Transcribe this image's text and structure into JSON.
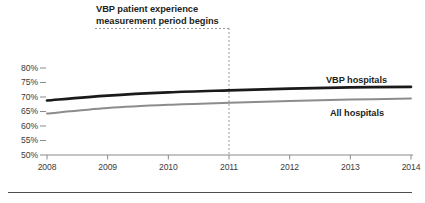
{
  "annotation": {
    "line1": "VBP patient experience",
    "line2": "measurement period begins",
    "marker_year": 2011
  },
  "axes": {
    "y_ticks": [
      "80%",
      "75%",
      "70%",
      "65%",
      "60%",
      "55%",
      "50%"
    ],
    "x_ticks": [
      "2008",
      "2009",
      "2010",
      "2011",
      "2012",
      "2013",
      "2014"
    ]
  },
  "legend": {
    "vbp": "VBP hospitals",
    "all": "All hospitals"
  },
  "colors": {
    "vbp_line": "#1a1a1a",
    "all_line": "#8c8c8c",
    "axis": "#8a8a8a",
    "text": "#231f20",
    "dashed": "#9a9a9a",
    "rule": "#4d4d4d"
  },
  "chart_data": {
    "type": "line",
    "title": "",
    "subtitle": "",
    "xlabel": "",
    "ylabel": "",
    "x": [
      2008,
      2009,
      2010,
      2011,
      2012,
      2013,
      2014
    ],
    "xlim": [
      2008,
      2014
    ],
    "ylim": [
      50,
      80
    ],
    "y_tick_values": [
      80,
      75,
      70,
      65,
      60,
      55,
      50
    ],
    "grid": false,
    "legend_position": "right-inline",
    "series": [
      {
        "name": "VBP hospitals",
        "color": "#1a1a1a",
        "values": [
          68.8,
          70.5,
          71.6,
          72.3,
          72.9,
          73.3,
          73.5
        ]
      },
      {
        "name": "All hospitals",
        "color": "#8c8c8c",
        "values": [
          64.3,
          66.2,
          67.3,
          68.0,
          68.6,
          69.1,
          69.5
        ]
      }
    ],
    "annotations": [
      {
        "text": "VBP patient experience measurement period begins",
        "x": 2011,
        "style": "dashed-vertical-with-underline"
      }
    ]
  }
}
